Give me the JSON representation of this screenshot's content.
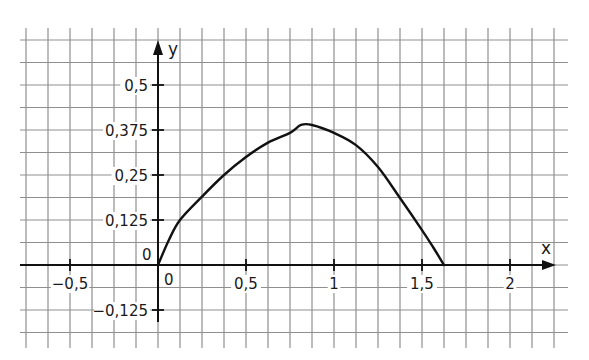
{
  "chart_data": {
    "type": "line",
    "title": "",
    "xlabel": "x",
    "ylabel": "y",
    "xlim": [
      -0.78,
      2.2
    ],
    "ylim": [
      -0.19,
      0.56
    ],
    "grid": true,
    "grid_step": {
      "x": 0.125,
      "y": 0.0625
    },
    "x_ticks": [
      {
        "value": -0.5,
        "label": "−0,5"
      },
      {
        "value": 0.5,
        "label": "0,5"
      },
      {
        "value": 1,
        "label": "1"
      },
      {
        "value": 1.5,
        "label": "1,5"
      },
      {
        "value": 2,
        "label": "2"
      }
    ],
    "y_ticks": [
      {
        "value": 0.5,
        "label": "0,5"
      },
      {
        "value": 0.375,
        "label": "0,375"
      },
      {
        "value": 0.25,
        "label": "0,25"
      },
      {
        "value": 0.125,
        "label": "0,125"
      },
      {
        "value": -0.125,
        "label": "−0,125"
      }
    ],
    "origin_labels": {
      "x": "0",
      "y": "0"
    },
    "series": [
      {
        "name": "f(x)",
        "x": [
          0,
          0.0625,
          0.125,
          0.25,
          0.375,
          0.5,
          0.625,
          0.75,
          0.8125,
          0.875,
          1.0,
          1.125,
          1.25,
          1.375,
          1.5,
          1.5625,
          1.625
        ],
        "y": [
          0,
          0.07,
          0.125,
          0.19,
          0.25,
          0.3,
          0.34,
          0.367,
          0.389,
          0.389,
          0.367,
          0.333,
          0.272,
          0.186,
          0.097,
          0.05,
          0
        ]
      }
    ]
  },
  "layout": {
    "origin_px": {
      "x": 158,
      "y": 265
    },
    "px_per_unit": {
      "x": 176,
      "y": 360
    },
    "grid_px": {
      "left": 26,
      "right": 555,
      "top": 40,
      "bottom": 333,
      "h_extent_left": 20,
      "h_extent_right": 568,
      "v_extent_top": 28,
      "v_extent_bottom": 348
    },
    "colors": {
      "grid": "#8f8f8f",
      "axis": "#111111",
      "curve": "#111111",
      "background": "#ffffff"
    }
  }
}
